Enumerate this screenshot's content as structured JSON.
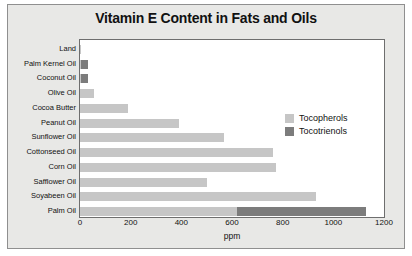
{
  "chart_data": {
    "type": "bar",
    "orientation": "horizontal",
    "stacked": true,
    "title": "Vitamin E Content in Fats and Oils",
    "xlabel": "ppm",
    "ylabel": "",
    "xlim": [
      0,
      1200
    ],
    "xticks": [
      0,
      200,
      400,
      600,
      800,
      1000,
      1200
    ],
    "xtick_labels": [
      "0",
      "200",
      "400",
      "600",
      "800",
      "1000",
      "1200"
    ],
    "grid": false,
    "legend_position": "inside-right-upper",
    "categories": [
      "Land",
      "Palm Kernel Oil",
      "Coconut Oil",
      "Olive Oil",
      "Cocoa Butter",
      "Peanut Oil",
      "Sunflower Oil",
      "Cottonseed Oil",
      "Corn  Oil",
      "Safflower Oil",
      "Soyabeen Oil",
      "Palm Oil"
    ],
    "series": [
      {
        "name": "Tocopherols",
        "color": "#c6c6c6",
        "values": [
          5,
          5,
          5,
          55,
          190,
          390,
          570,
          760,
          775,
          500,
          930,
          620
        ]
      },
      {
        "name": "Tocotrienols",
        "color": "#7c7c7c",
        "values": [
          0,
          25,
          25,
          0,
          0,
          0,
          0,
          0,
          0,
          0,
          0,
          510
        ]
      }
    ],
    "totals": [
      5,
      30,
      30,
      55,
      190,
      390,
      570,
      760,
      775,
      500,
      930,
      1130
    ],
    "legend": [
      "Tocopherols",
      "Tocotrienols"
    ]
  },
  "colors": {
    "tocopherols": "#c6c6c6",
    "tocotrienols": "#7c7c7c",
    "figure_background": "#e8e8e6",
    "plot_background": "#ffffff",
    "frame_border": "#8f8f8f",
    "axis_border": "#6e6e6e",
    "text": "#111111"
  }
}
